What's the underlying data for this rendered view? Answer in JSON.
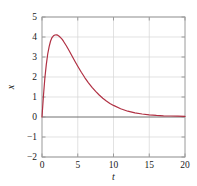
{
  "chart_data": {
    "type": "line",
    "title": "",
    "xlabel": "t",
    "ylabel": "x",
    "xlim": [
      0,
      20
    ],
    "ylim": [
      -2,
      5
    ],
    "xticks": [
      0,
      5,
      10,
      15,
      20
    ],
    "xtick_labels": [
      "0",
      "5",
      "10",
      "15",
      "20"
    ],
    "yticks": [
      -2,
      -1,
      0,
      1,
      2,
      3,
      4,
      5
    ],
    "ytick_labels": [
      "−2",
      "−1",
      "0",
      "1",
      "2",
      "3",
      "4",
      "5"
    ],
    "grid": true,
    "legend": null,
    "series": [
      {
        "name": "x(t)",
        "color": "#b03043",
        "linewidth": 1.2,
        "x": [
          0.0,
          0.2,
          0.4,
          0.6,
          0.8,
          1.0,
          1.2,
          1.4,
          1.6,
          1.8,
          2.0,
          2.2,
          2.4,
          2.6,
          2.8,
          3.0,
          3.4,
          3.8,
          4.2,
          4.6,
          5.0,
          5.5,
          6.0,
          6.5,
          7.0,
          7.5,
          8.0,
          8.5,
          9.0,
          9.5,
          10.0,
          11.0,
          12.0,
          13.0,
          14.0,
          15.0,
          16.0,
          17.0,
          18.0,
          19.0,
          20.0
        ],
        "y": [
          0.0,
          1.05,
          1.95,
          2.62,
          3.15,
          3.52,
          3.8,
          3.97,
          4.06,
          4.1,
          4.11,
          4.09,
          4.04,
          3.97,
          3.89,
          3.79,
          3.56,
          3.31,
          3.05,
          2.79,
          2.54,
          2.24,
          1.96,
          1.71,
          1.48,
          1.28,
          1.1,
          0.94,
          0.8,
          0.68,
          0.58,
          0.41,
          0.29,
          0.21,
          0.15,
          0.11,
          0.08,
          0.06,
          0.05,
          0.04,
          0.03
        ]
      }
    ],
    "zero_line": {
      "value": 0,
      "color": "#707070"
    },
    "colors": {
      "curve": "#b03043",
      "grid": "#d6d6d6",
      "frame": "#9a9a9a",
      "text": "#1a1a1a",
      "background": "#ffffff"
    }
  },
  "axes": {
    "plot_left_px": 42,
    "plot_right_px": 185,
    "plot_top_px": 17,
    "plot_bottom_px": 157
  }
}
